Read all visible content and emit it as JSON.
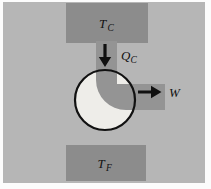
{
  "figure": {
    "name": "heat-engine-schematic",
    "labels": {
      "hot_reservoir": {
        "main": "T",
        "sub": "C"
      },
      "heat_in": {
        "main": "Q",
        "sub": "C"
      },
      "work_out": {
        "main": "W",
        "sub": ""
      },
      "cold_reservoir": {
        "main": "T",
        "sub": "F"
      }
    },
    "icons": {
      "heat_arrow": "arrow-down",
      "work_arrow": "arrow-right"
    },
    "colors": {
      "page_bg": "#fcfcfc",
      "diagram_bg": "#b6b6b6",
      "reservoir": "#8c8c8c",
      "pipe": "#949494",
      "engine_interior": "#eeede9",
      "ink": "#111111"
    }
  }
}
